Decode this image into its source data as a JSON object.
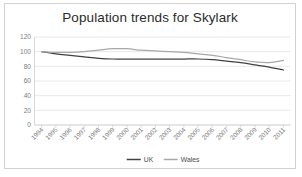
{
  "chart_data": {
    "type": "line",
    "title": "Population trends for Skylark",
    "xlabel": "",
    "ylabel": "",
    "ylim": [
      0,
      120
    ],
    "yticks": [
      0,
      20,
      40,
      60,
      80,
      100,
      120
    ],
    "grid": true,
    "legend_position": "bottom",
    "categories": [
      "1994",
      "1995",
      "1996",
      "1997",
      "1998",
      "1999",
      "2000",
      "2001",
      "2002",
      "2003",
      "2004",
      "2005",
      "2006",
      "2007",
      "2008",
      "2009",
      "2010",
      "2011"
    ],
    "series": [
      {
        "name": "UK",
        "color": "#404040",
        "values": [
          100,
          97,
          95,
          93,
          91,
          90,
          90,
          90,
          90,
          90,
          90,
          90,
          89,
          87,
          85,
          82,
          79,
          75
        ]
      },
      {
        "name": "Wales",
        "color": "#a8a8a8",
        "values": [
          100,
          99,
          99,
          100,
          102,
          104,
          104,
          102,
          101,
          100,
          99,
          97,
          95,
          92,
          89,
          86,
          85,
          88
        ]
      }
    ]
  },
  "legend": {
    "items": [
      {
        "label": "UK",
        "color": "#404040"
      },
      {
        "label": "Wales",
        "color": "#a8a8a8"
      }
    ]
  },
  "colors": {
    "frame_border": "#d2d2d2",
    "gridline": "#e2e2e2",
    "tick_text": "#7c7c7c",
    "title_text": "#2b2b2b",
    "background": "#ffffff"
  }
}
